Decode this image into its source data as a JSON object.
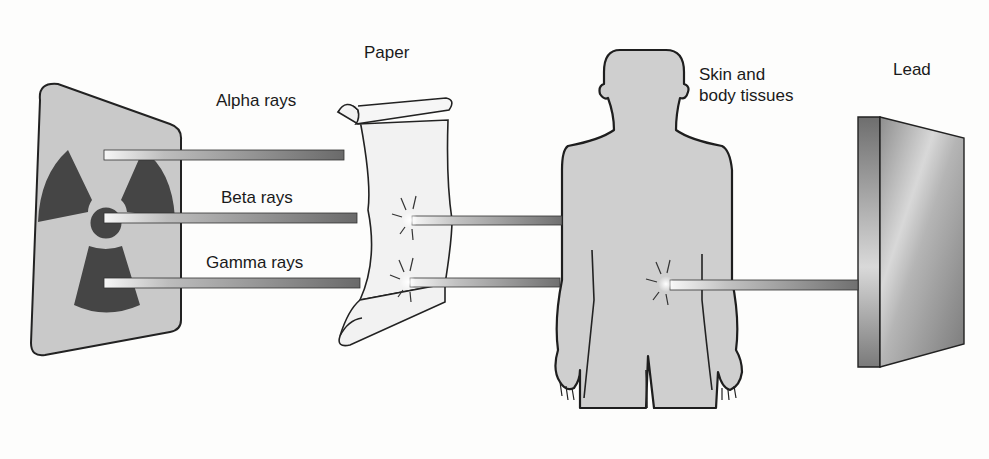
{
  "diagram": {
    "colors": {
      "background": "#fdfdfc",
      "source_panel": "#c9c9c9",
      "trefoil": "#454545",
      "ray_dark": "#6a6a6a",
      "ray_light": "#f4f4f4",
      "paper": "#f2f2f2",
      "body": "#cfcfcf",
      "outline": "#222222",
      "lead_front": "#9b9b9b",
      "lead_side": "#7d7d7d"
    },
    "source": {
      "name": "Radioactive source",
      "icon": "radiation-trefoil-icon"
    },
    "rays": [
      {
        "label": "Alpha rays",
        "stopped_by": "Paper"
      },
      {
        "label": "Beta rays",
        "stopped_by": "Skin and body tissues"
      },
      {
        "label": "Gamma rays",
        "stopped_by": "Lead"
      }
    ],
    "barriers": [
      {
        "label": "Paper"
      },
      {
        "label": "Skin and\nbody tissues",
        "line1": "Skin and",
        "line2": "body tissues"
      },
      {
        "label": "Lead"
      }
    ]
  }
}
